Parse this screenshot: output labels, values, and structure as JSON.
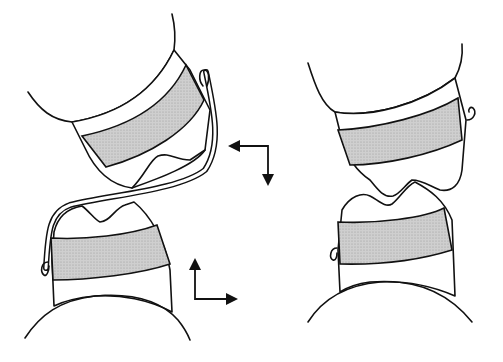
{
  "figure": {
    "type": "dental-diagram",
    "panels": [
      {
        "id": "left",
        "description": "upper and lower tooth with wire appliance (before)"
      },
      {
        "id": "right",
        "description": "upper and lower tooth in occlusion (after)"
      }
    ],
    "arrows": [
      {
        "id": "upper-arrow",
        "directions": [
          "left",
          "down"
        ]
      },
      {
        "id": "lower-arrow",
        "directions": [
          "up",
          "right"
        ]
      }
    ],
    "colors": {
      "line": "#111111",
      "band_fill": "#c8c8c8",
      "background": "#ffffff"
    }
  }
}
